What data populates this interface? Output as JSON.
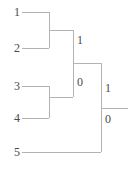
{
  "figure": {
    "name": "dendrogram",
    "type": "binary-merge-tree",
    "background_color": "#ffffff",
    "line_color": "#b3b3b3",
    "line_width": 1,
    "text_color": "#4a4a4a"
  },
  "leaves": [
    {
      "id": "leaf-1",
      "label": "1",
      "x_text": 12,
      "y_text": 6,
      "line_y": 12,
      "line_x1": 22,
      "line_x2": 49
    },
    {
      "id": "leaf-2",
      "label": "2",
      "x_text": 12,
      "y_text": 42,
      "line_y": 48,
      "line_x1": 22,
      "line_x2": 49
    },
    {
      "id": "leaf-3",
      "label": "3",
      "x_text": 12,
      "y_text": 80,
      "line_y": 86,
      "line_x1": 22,
      "line_x2": 49
    },
    {
      "id": "leaf-4",
      "label": "4",
      "x_text": 12,
      "y_text": 112,
      "line_y": 118,
      "line_x1": 22,
      "line_x2": 49
    },
    {
      "id": "leaf-5",
      "label": "5",
      "x_text": 12,
      "y_text": 146,
      "line_y": 152,
      "line_x1": 22,
      "line_x2": 101
    }
  ],
  "merges": [
    {
      "id": "merge-1-2",
      "members": "1,2",
      "x": 49,
      "y_top": 12,
      "y_bottom": 48,
      "stem_y": 30,
      "stem_x2": 73
    },
    {
      "id": "merge-3-4",
      "members": "3,4",
      "x": 49,
      "y_top": 86,
      "y_bottom": 118,
      "stem_y": 97,
      "stem_x2": 73
    },
    {
      "id": "merge-12-34",
      "members": "12,34",
      "x": 73,
      "y_top": 30,
      "y_bottom": 97,
      "stem_y": 63,
      "stem_x2": 101
    },
    {
      "id": "merge-root",
      "members": "1234,5",
      "x": 101,
      "y_top": 63,
      "y_bottom": 152,
      "stem_y": 108,
      "stem_x2": 128
    }
  ],
  "branch_labels": [
    {
      "id": "branch-label-upper-1",
      "label": "1",
      "x": 77,
      "y": 34,
      "edge": "merge-12-34-upper"
    },
    {
      "id": "branch-label-lower-0",
      "label": "0",
      "x": 77,
      "y": 76,
      "edge": "merge-12-34-lower"
    },
    {
      "id": "branch-label-root-1",
      "label": "1",
      "x": 105,
      "y": 82,
      "edge": "merge-root-upper"
    },
    {
      "id": "branch-label-root-0",
      "label": "0",
      "x": 105,
      "y": 113,
      "edge": "merge-root-lower"
    }
  ]
}
